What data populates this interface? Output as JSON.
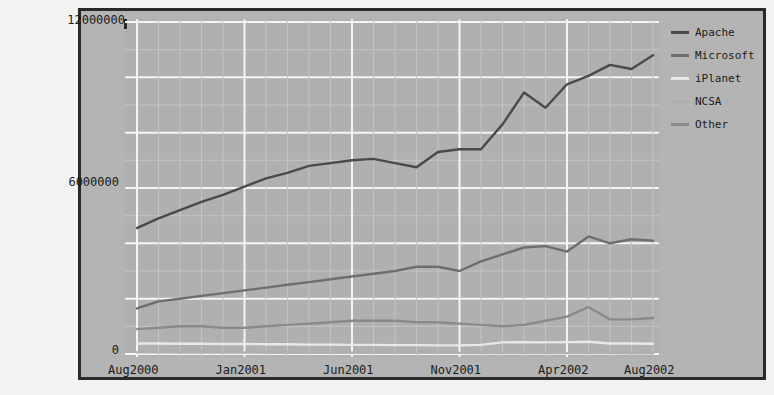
{
  "chart_data": {
    "type": "line",
    "title": "",
    "xlabel": "",
    "ylabel": "",
    "ylim": [
      0,
      12000000
    ],
    "grid": true,
    "legend_position": "right",
    "y_ticks": [
      "0",
      "6000000",
      "12000000"
    ],
    "y_tick_values": [
      0,
      6000000,
      12000000
    ],
    "x_tick_labels": [
      "Aug2000",
      "Jan2001",
      "Jun2001",
      "Nov2001",
      "Apr2002",
      "Aug2002"
    ],
    "x_tick_indices": [
      0,
      5,
      10,
      15,
      20,
      24
    ],
    "x": [
      "Aug2000",
      "Sep2000",
      "Oct2000",
      "Nov2000",
      "Dec2000",
      "Jan2001",
      "Feb2001",
      "Mar2001",
      "Apr2001",
      "May2001",
      "Jun2001",
      "Jul2001",
      "Aug2001",
      "Sep2001",
      "Oct2001",
      "Nov2001",
      "Dec2001",
      "Jan2002",
      "Feb2002",
      "Mar2002",
      "Apr2002",
      "May2002",
      "Jun2002",
      "Jul2002",
      "Aug2002"
    ],
    "series": [
      {
        "name": "Apache",
        "color": "#4a4a4a",
        "values": [
          4550000,
          4900000,
          5200000,
          5500000,
          5750000,
          6050000,
          6350000,
          6550000,
          6800000,
          6900000,
          7000000,
          7050000,
          6900000,
          6750000,
          7300000,
          7400000,
          7400000,
          8300000,
          9450000,
          8900000,
          9750000,
          10050000,
          10450000,
          10300000,
          10800000
        ]
      },
      {
        "name": "Microsoft",
        "color": "#6e6e6e",
        "values": [
          1650000,
          1900000,
          2000000,
          2100000,
          2200000,
          2300000,
          2400000,
          2500000,
          2600000,
          2700000,
          2800000,
          2900000,
          3000000,
          3150000,
          3150000,
          3000000,
          3350000,
          3600000,
          3850000,
          3900000,
          3700000,
          4250000,
          4000000,
          4150000,
          4100000
        ]
      },
      {
        "name": "iPlanet",
        "color": "#e8e8e8",
        "values": [
          380000,
          380000,
          370000,
          370000,
          360000,
          360000,
          350000,
          350000,
          340000,
          340000,
          330000,
          330000,
          320000,
          320000,
          310000,
          310000,
          330000,
          420000,
          430000,
          420000,
          430000,
          440000,
          380000,
          380000,
          370000
        ]
      },
      {
        "name": "NCSA",
        "color": "#b0b0b0",
        "values": [
          60000,
          58000,
          56000,
          54000,
          52000,
          50000,
          48000,
          46000,
          45000,
          44000,
          43000,
          42000,
          41000,
          40000,
          39000,
          38000,
          37000,
          36000,
          35000,
          34000,
          33000,
          32000,
          31000,
          30000,
          29000
        ]
      },
      {
        "name": "Other",
        "color": "#8a8a8a",
        "values": [
          900000,
          950000,
          1000000,
          1000000,
          950000,
          950000,
          1000000,
          1050000,
          1100000,
          1150000,
          1200000,
          1200000,
          1200000,
          1150000,
          1150000,
          1100000,
          1050000,
          1000000,
          1050000,
          1200000,
          1350000,
          1700000,
          1250000,
          1250000,
          1300000
        ]
      }
    ]
  },
  "legend": {
    "items": [
      {
        "label": "Apache",
        "color": "#4a4a4a"
      },
      {
        "label": "Microsoft",
        "color": "#6e6e6e"
      },
      {
        "label": "iPlanet",
        "color": "#e8e8e8"
      },
      {
        "label": "NCSA",
        "color": "#b0b0b0"
      },
      {
        "label": "Other",
        "color": "#8a8a8a"
      }
    ]
  },
  "axis": {
    "y_top": "12000000",
    "y_mid": "6000000",
    "y_bottom": "0"
  }
}
